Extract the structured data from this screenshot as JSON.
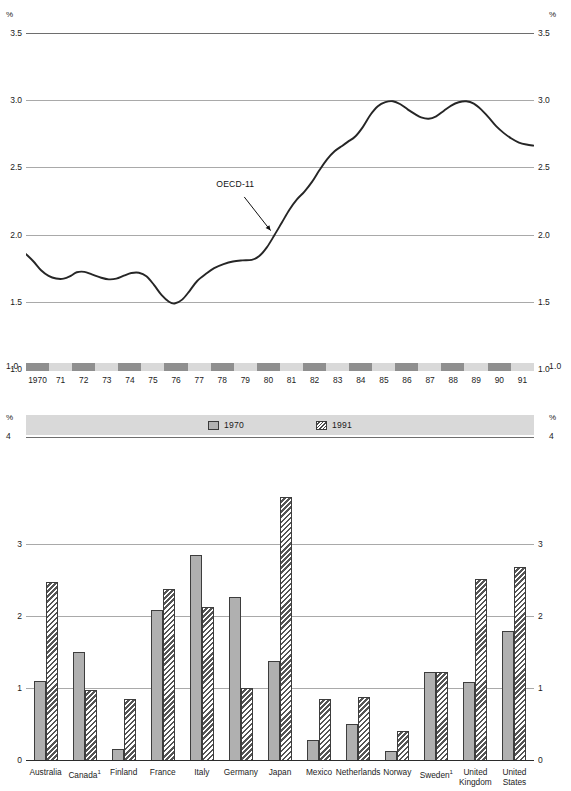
{
  "title": "",
  "line_chart_labels": {
    "unit_left": "%",
    "unit_right": "%",
    "annotation": "OECD-11"
  },
  "bar_chart_labels": {
    "unit_left": "%",
    "unit_right": "%"
  },
  "legend": {
    "items": [
      {
        "label": "1970",
        "pattern": "solid"
      },
      {
        "label": "1991",
        "pattern": "hatch"
      }
    ]
  },
  "chart_data": [
    {
      "type": "line",
      "title": "",
      "xlabel": "",
      "ylabel": "%",
      "ylim": [
        1.0,
        3.5
      ],
      "yticks": [
        1.0,
        1.5,
        2.0,
        2.5,
        3.0,
        3.5
      ],
      "ytick_labels": [
        "1.0",
        "1.5",
        "2.0",
        "2.5",
        "3.0",
        "3.5"
      ],
      "grid": true,
      "legend_position": "none",
      "annotations": [
        {
          "text": "OECD-11",
          "x": 1982,
          "y": 2.72
        }
      ],
      "x": [
        1970,
        1971,
        1972,
        1973,
        1974,
        1975,
        1976,
        1977,
        1978,
        1979,
        1980,
        1981,
        1982,
        1983,
        1984,
        1985,
        1986,
        1987,
        1988,
        1989,
        1990,
        1991
      ],
      "xtick_labels": [
        "1970",
        "71",
        "72",
        "73",
        "74",
        "75",
        "76",
        "77",
        "78",
        "79",
        "80",
        "81",
        "82",
        "83",
        "84",
        "85",
        "86",
        "87",
        "88",
        "89",
        "90",
        "91"
      ],
      "series": [
        {
          "name": "OECD-11",
          "values": [
            1.85,
            1.7,
            1.68,
            1.73,
            1.69,
            1.68,
            1.72,
            1.66,
            1.49,
            1.58,
            1.73,
            1.8,
            1.8,
            1.81,
            1.88,
            2.05,
            2.22,
            2.45,
            2.57,
            2.67,
            2.75,
            2.88
          ]
        }
      ],
      "series_dense": {
        "name": "OECD-11",
        "points": [
          [
            1970.0,
            1.855
          ],
          [
            1970.4,
            1.8
          ],
          [
            1970.8,
            1.735
          ],
          [
            1971.2,
            1.693
          ],
          [
            1971.6,
            1.673
          ],
          [
            1972.0,
            1.672
          ],
          [
            1972.4,
            1.695
          ],
          [
            1972.7,
            1.72
          ],
          [
            1973.1,
            1.723
          ],
          [
            1973.5,
            1.704
          ],
          [
            1974.0,
            1.679
          ],
          [
            1974.4,
            1.667
          ],
          [
            1974.8,
            1.672
          ],
          [
            1975.2,
            1.694
          ],
          [
            1975.6,
            1.714
          ],
          [
            1976.0,
            1.716
          ],
          [
            1976.4,
            1.69
          ],
          [
            1976.8,
            1.626
          ],
          [
            1977.2,
            1.551
          ],
          [
            1977.6,
            1.5
          ],
          [
            1977.9,
            1.487
          ],
          [
            1978.3,
            1.516
          ],
          [
            1978.7,
            1.582
          ],
          [
            1979.1,
            1.655
          ],
          [
            1979.6,
            1.712
          ],
          [
            1980.0,
            1.75
          ],
          [
            1980.5,
            1.78
          ],
          [
            1981.0,
            1.8
          ],
          [
            1981.5,
            1.808
          ],
          [
            1982.0,
            1.812
          ],
          [
            1982.4,
            1.84
          ],
          [
            1982.8,
            1.905
          ],
          [
            1983.2,
            1.995
          ],
          [
            1983.6,
            2.09
          ],
          [
            1984.0,
            2.185
          ],
          [
            1984.4,
            2.262
          ],
          [
            1984.8,
            2.32
          ],
          [
            1985.2,
            2.392
          ],
          [
            1985.6,
            2.48
          ],
          [
            1986.0,
            2.56
          ],
          [
            1986.4,
            2.62
          ],
          [
            1986.8,
            2.66
          ],
          [
            1987.1,
            2.69
          ],
          [
            1987.5,
            2.73
          ],
          [
            1987.9,
            2.8
          ],
          [
            1988.3,
            2.89
          ],
          [
            1988.7,
            2.955
          ],
          [
            1989.1,
            2.985
          ],
          [
            1989.5,
            2.992
          ],
          [
            1989.9,
            2.97
          ],
          [
            1990.3,
            2.93
          ],
          [
            1990.7,
            2.895
          ],
          [
            1991.0,
            2.872
          ],
          [
            1991.4,
            2.862
          ],
          [
            1991.8,
            2.88
          ],
          [
            1992.2,
            2.92
          ],
          [
            1992.6,
            2.96
          ],
          [
            1993.0,
            2.985
          ],
          [
            1993.4,
            2.992
          ],
          [
            1993.8,
            2.975
          ],
          [
            1994.2,
            2.93
          ],
          [
            1994.6,
            2.87
          ],
          [
            1995.0,
            2.805
          ],
          [
            1995.4,
            2.755
          ],
          [
            1995.8,
            2.715
          ],
          [
            1996.2,
            2.685
          ],
          [
            1996.6,
            2.67
          ],
          [
            1997.0,
            2.662
          ]
        ]
      }
    },
    {
      "type": "bar",
      "title": "",
      "xlabel": "",
      "ylabel": "%",
      "ylim": [
        0,
        4
      ],
      "yticks": [
        0,
        1,
        2,
        3,
        4
      ],
      "ytick_labels": [
        "0",
        "1",
        "2",
        "3",
        "4"
      ],
      "grid": true,
      "legend_position": "top-center",
      "categories": [
        "Australia",
        "Canada",
        "Finland",
        "France",
        "Italy",
        "Germany",
        "Japan",
        "Mexico",
        "Netherlands",
        "Norway",
        "Sweden",
        "United Kingdom",
        "United States"
      ],
      "category_footnotes": {
        "Canada": "1",
        "Sweden": "1"
      },
      "series": [
        {
          "name": "1970",
          "values": [
            1.1,
            1.5,
            0.15,
            2.08,
            2.85,
            2.26,
            1.38,
            0.28,
            0.5,
            0.13,
            1.22,
            1.08,
            1.79
          ]
        },
        {
          "name": "1991",
          "values": [
            2.47,
            0.97,
            0.85,
            2.37,
            2.13,
            1.0,
            3.65,
            0.85,
            0.87,
            0.4,
            1.22,
            2.52,
            2.68
          ]
        }
      ]
    }
  ]
}
